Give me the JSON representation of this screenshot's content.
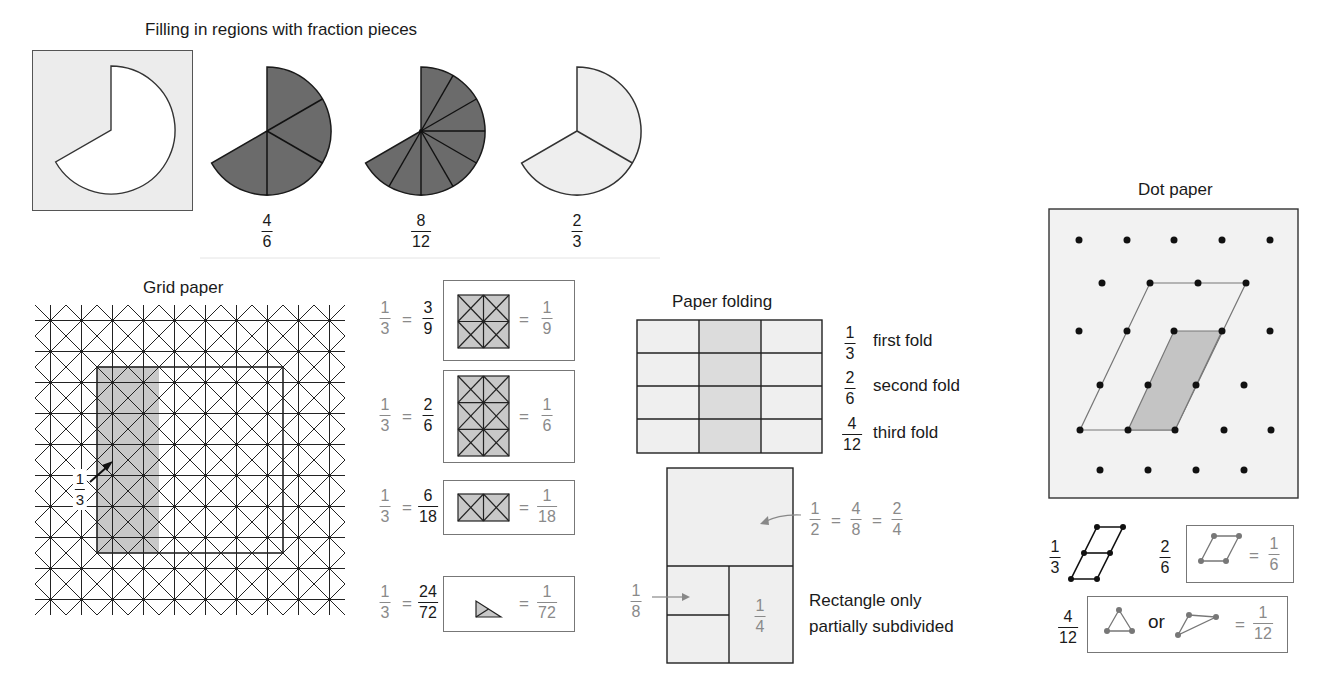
{
  "sections": {
    "fraction_pieces": {
      "title": "Filling in regions with fraction pieces",
      "region": {
        "shape": "two-thirds circle",
        "fill": "#ffffff",
        "background": "#ececec"
      },
      "pies": [
        {
          "label_num": "4",
          "label_den": "6",
          "pieces": 4,
          "piece_angle": 60,
          "fill": "#6b6b6b"
        },
        {
          "label_num": "8",
          "label_den": "12",
          "pieces": 8,
          "piece_angle": 30,
          "fill": "#6b6b6b"
        },
        {
          "label_num": "2",
          "label_den": "3",
          "pieces": 2,
          "piece_angle": 120,
          "fill": "#eeeeee"
        }
      ]
    },
    "grid_paper": {
      "title": "Grid paper",
      "columns": 10,
      "rows": 10,
      "shaded_label_num": "1",
      "shaded_label_den": "3",
      "shaded_color": "#c8c8c8",
      "equivalences": [
        {
          "left_num": "1",
          "left_den": "3",
          "mid_num": "3",
          "mid_den": "9",
          "right_num": "1",
          "right_den": "9",
          "piece": "2x2 grid"
        },
        {
          "left_num": "1",
          "left_den": "3",
          "mid_num": "2",
          "mid_den": "6",
          "right_num": "1",
          "right_den": "6",
          "piece": "2x3 grid"
        },
        {
          "left_num": "1",
          "left_den": "3",
          "mid_num": "6",
          "mid_den": "18",
          "right_num": "1",
          "right_den": "18",
          "piece": "2x1 grid"
        },
        {
          "left_num": "1",
          "left_den": "3",
          "mid_num": "24",
          "mid_den": "72",
          "right_num": "1",
          "right_den": "72",
          "piece": "small triangle"
        }
      ],
      "equals": "="
    },
    "paper_folding": {
      "title": "Paper folding",
      "folds": [
        {
          "num": "1",
          "den": "3",
          "text": "first fold"
        },
        {
          "num": "2",
          "den": "6",
          "text": "second fold"
        },
        {
          "num": "4",
          "den": "12",
          "text": "third fold"
        }
      ],
      "partial": {
        "half_labels": [
          {
            "num": "1",
            "den": "2"
          },
          {
            "num": "4",
            "den": "8"
          },
          {
            "num": "2",
            "den": "4"
          }
        ],
        "eighth": {
          "num": "1",
          "den": "8"
        },
        "quarter": {
          "num": "1",
          "den": "4"
        },
        "caption_line1": "Rectangle only",
        "caption_line2": "partially subdivided"
      }
    },
    "dot_paper": {
      "title": "Dot paper",
      "legend": {
        "third": {
          "num": "1",
          "den": "3"
        },
        "sixth": {
          "num": "2",
          "den": "6",
          "result_num": "1",
          "result_den": "6"
        },
        "twelfth": {
          "num": "4",
          "den": "12",
          "or": "or",
          "result_num": "1",
          "result_den": "12"
        }
      },
      "shaded_color": "#c4c4c4"
    }
  },
  "colors": {
    "line": "#1a1a1a",
    "gray_text": "#8a8a8a",
    "light_fill": "#ececec"
  }
}
